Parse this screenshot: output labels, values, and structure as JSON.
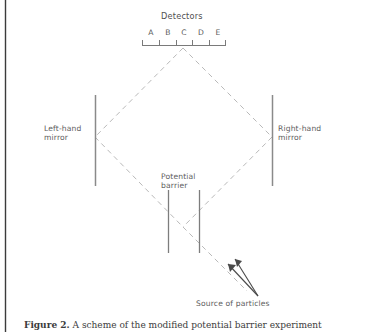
{
  "figure": {
    "detectors": {
      "title": "Detectors",
      "labels": [
        "A",
        "B",
        "C",
        "D",
        "E"
      ]
    },
    "left_mirror": {
      "line1": "Left-hand",
      "line2": "mirror"
    },
    "right_mirror": {
      "line1": "Right-hand",
      "line2": "mirror"
    },
    "potential_barrier": {
      "line1": "Potential",
      "line2": "barrier"
    },
    "source": {
      "label": "Source of particles"
    },
    "caption": {
      "number": "Figure 2.",
      "text": "A scheme of the modified potential barrier experiment"
    },
    "colors": {
      "beam_path": "#b9b9b9",
      "mirror": "#8a8a8a",
      "barrier": "#7d7d7d",
      "detector_bar": "#7a7a7a",
      "arrow": "#4a4a4a",
      "text": "#5a5a5a",
      "page_border": "#3b3b3b",
      "background": "#ffffff"
    },
    "geometry": {
      "apex": [
        183,
        48
      ],
      "left_vertex": [
        95,
        137
      ],
      "right_vertex": [
        272,
        137
      ],
      "bottom_vertex": [
        183,
        227
      ],
      "detector_bar_x_start": 142,
      "detector_bar_x_end": 226,
      "detector_bar_y": 45,
      "mirror_y_top": 95,
      "mirror_y_bottom": 186,
      "barrier_left_x": 168,
      "barrier_right_x": 199,
      "barrier_y_top": 190,
      "barrier_y_bottom": 253
    }
  }
}
